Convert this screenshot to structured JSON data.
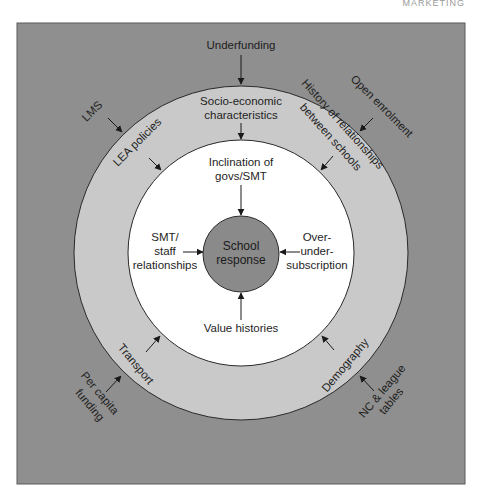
{
  "running_head": "MARKETING",
  "colors": {
    "outer_box": "#8f8f8f",
    "outer_ring": "#c9c9c9",
    "inner_circle": "#ffffff",
    "core": "#8a8a8a",
    "stroke": "#2a2a2a"
  },
  "diagram": {
    "core": {
      "line1": "School",
      "line2": "response"
    },
    "inner_factors": {
      "top": {
        "line1": "Inclination of",
        "line2": "govs/SMT"
      },
      "left": {
        "line1": "SMT/",
        "line2": "staff",
        "line3": "relationships"
      },
      "right": {
        "line1": "Over-",
        "line2": "under-",
        "line3": "subscription"
      },
      "bottom": {
        "line1": "Value histories"
      }
    },
    "middle_factors": {
      "top": {
        "line1": "Socio-economic",
        "line2": "characteristics"
      },
      "top_left": {
        "line1": "LEA policies"
      },
      "top_right": {
        "line1": "History of relationships",
        "line2": "between schools"
      },
      "bottom_left": {
        "line1": "Transport"
      },
      "bottom_right": {
        "line1": "Demography"
      }
    },
    "outer_factors": {
      "top": {
        "line1": "Underfunding"
      },
      "top_left": {
        "line1": "LMS"
      },
      "top_right": {
        "line1": "Open enrolment"
      },
      "bottom_left": {
        "line1": "Per capita",
        "line2": "funding"
      },
      "bottom_right": {
        "line1": "NC & league",
        "line2": "tables"
      }
    }
  }
}
